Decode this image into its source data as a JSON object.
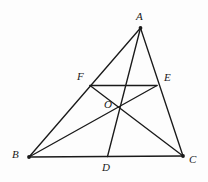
{
  "figure": {
    "kind": "euclidean-geometry-diagram",
    "background_color": "#fdfdfd",
    "stroke_color": "#1a1a1a",
    "label_color": "#1a1a1a",
    "canvas": {
      "width": 208,
      "height": 182
    },
    "points": [
      {
        "id": "A",
        "label": "A",
        "x": 140.5,
        "y": 28.0,
        "label_x": 136.0,
        "label_y": 11.0,
        "dot": true
      },
      {
        "id": "B",
        "label": "B",
        "x": 29.0,
        "y": 157.0,
        "label_x": 12.0,
        "label_y": 149.0,
        "dot": true
      },
      {
        "id": "C",
        "label": "C",
        "x": 183.0,
        "y": 156.0,
        "label_x": 189.0,
        "label_y": 154.0,
        "dot": true
      },
      {
        "id": "D",
        "label": "D",
        "x": 107.5,
        "y": 156.5,
        "label_x": 102.0,
        "label_y": 162.0,
        "dot": false
      },
      {
        "id": "E",
        "label": "E",
        "x": 157.0,
        "y": 85.5,
        "label_x": 164.0,
        "label_y": 72.0,
        "dot": false
      },
      {
        "id": "F",
        "label": "F",
        "x": 90.0,
        "y": 85.5,
        "label_x": 77.0,
        "label_y": 71.0,
        "dot": false
      },
      {
        "id": "O",
        "label": "O",
        "x": 118.0,
        "y": 108.0,
        "label_x": 104.0,
        "label_y": 99.0,
        "dot": false
      }
    ],
    "segments": [
      {
        "name": "side-AB",
        "from": "A",
        "to": "B"
      },
      {
        "name": "side-BC",
        "from": "B",
        "to": "C"
      },
      {
        "name": "side-CA",
        "from": "C",
        "to": "A"
      },
      {
        "name": "cevian-AD",
        "from": "A",
        "to": "D"
      },
      {
        "name": "cevian-BE",
        "from": "B",
        "to": "E"
      },
      {
        "name": "cevian-CF",
        "from": "C",
        "to": "F"
      },
      {
        "name": "segment-FE",
        "from": "F",
        "to": "E"
      }
    ]
  }
}
